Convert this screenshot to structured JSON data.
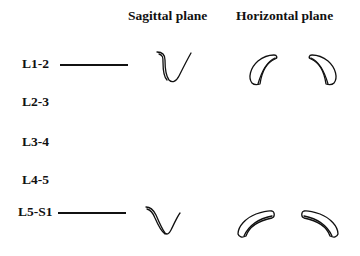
{
  "headers": {
    "sagittal": "Sagittal plane",
    "horizontal": "Horizontal plane"
  },
  "levels": [
    {
      "label": "L1-2",
      "has_indicator": true
    },
    {
      "label": "L2-3",
      "has_indicator": false
    },
    {
      "label": "L3-4",
      "has_indicator": false
    },
    {
      "label": "L4-5",
      "has_indicator": false
    },
    {
      "label": "L5-S1",
      "has_indicator": true
    }
  ],
  "shapes": {
    "L1-2": [
      "sagittal-v-narrow",
      "horizontal-crescent-left-tall",
      "horizontal-crescent-right-tall"
    ],
    "L5-S1": [
      "sagittal-v-wide",
      "horizontal-crescent-left-flat",
      "horizontal-crescent-right-flat"
    ]
  },
  "colors": {
    "ink": "#111111",
    "background": "#ffffff"
  }
}
